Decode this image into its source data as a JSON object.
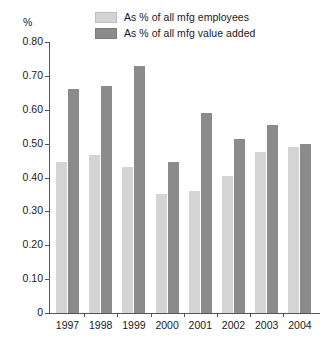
{
  "chart_data": {
    "type": "bar",
    "title": "",
    "subtitle": "",
    "xlabel": "",
    "ylabel": "%",
    "ylim": [
      0,
      0.8
    ],
    "ytick_labels": [
      "0.80",
      "0.70",
      "0.60",
      "0.50",
      "0.40",
      "0.30",
      "0.20",
      "0.10",
      "0"
    ],
    "ytick_values": [
      0.8,
      0.7,
      0.6,
      0.5,
      0.4,
      0.3,
      0.2,
      0.1,
      0
    ],
    "grid": false,
    "legend_position": "top-center",
    "categories": [
      "1997",
      "1998",
      "1999",
      "2000",
      "2001",
      "2002",
      "2003",
      "2004"
    ],
    "series": [
      {
        "name": "As % of all mfg employees",
        "color": "#d4d4d4",
        "values": [
          0.445,
          0.465,
          0.43,
          0.35,
          0.36,
          0.405,
          0.475,
          0.49
        ]
      },
      {
        "name": "As % of all mfg value added",
        "color": "#8b8b8b",
        "values": [
          0.66,
          0.67,
          0.73,
          0.445,
          0.59,
          0.515,
          0.555,
          0.5
        ]
      }
    ],
    "axis_color": "#555555",
    "background_color": "#ffffff"
  }
}
